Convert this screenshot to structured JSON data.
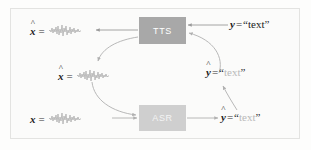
{
  "figure": {
    "background_color": "#fbfbfa",
    "border_color": "#e3e3e1"
  },
  "nodes": [
    {
      "id": "tts",
      "label": "TTS",
      "fill": "#a8a8a8",
      "text_color": "#ffffff"
    },
    {
      "id": "asr",
      "label": "ASR",
      "fill": "#cfcfcf",
      "text_color": "#f4f4f4"
    }
  ],
  "labels": {
    "top_left": {
      "name": "x-hat-top",
      "symbol": "x",
      "hat": "^",
      "equals": "=",
      "value_type": "waveform"
    },
    "middle_left": {
      "name": "x-hat-middle",
      "symbol": "x",
      "hat": "^",
      "equals": "=",
      "value_type": "waveform"
    },
    "bottom_left": {
      "name": "x-bottom",
      "symbol": "x",
      "hat": "",
      "equals": "=",
      "value_type": "waveform"
    },
    "top_right": {
      "name": "y-text",
      "symbol": "y",
      "hat": "",
      "equals": "=",
      "quote_open": "“",
      "value": "text",
      "quote_close": "”",
      "faded": false
    },
    "middle_right": {
      "name": "y-hat-text-middle",
      "symbol": "y",
      "hat": "^",
      "equals": "=",
      "quote_open": "“",
      "value": "text",
      "quote_close": "”",
      "faded": true
    },
    "bottom_right": {
      "name": "y-hat-text-bottom",
      "symbol": "y",
      "hat": "^",
      "equals": "=",
      "quote_open": "“",
      "value": "text",
      "quote_close": "”",
      "faded": true
    }
  },
  "edges": [
    {
      "name": "tts-to-xhat-top",
      "from": "tts",
      "to": "x-hat-top",
      "style": "straight",
      "direction": "left"
    },
    {
      "name": "y-text-to-tts",
      "from": "y-text",
      "to": "tts",
      "style": "straight",
      "direction": "left"
    },
    {
      "name": "yhat-middle-to-tts",
      "from": "y-hat-text-middle",
      "to": "tts",
      "style": "curved",
      "direction": "up-left"
    },
    {
      "name": "tts-to-xhat-middle",
      "from": "tts",
      "to": "x-hat-middle",
      "style": "curved",
      "direction": "down-left"
    },
    {
      "name": "xhat-middle-to-asr",
      "from": "x-hat-middle",
      "to": "asr",
      "style": "curved",
      "direction": "down-right"
    },
    {
      "name": "x-to-asr",
      "from": "x-bottom",
      "to": "asr",
      "style": "straight",
      "direction": "right"
    },
    {
      "name": "asr-to-yhat-bottom",
      "from": "asr",
      "to": "y-hat-text-bottom",
      "style": "straight",
      "direction": "right"
    },
    {
      "name": "yhat-bottom-to-yhat-middle",
      "from": "y-hat-text-bottom",
      "to": "y-hat-text-middle",
      "style": "curved",
      "direction": "up-left"
    }
  ],
  "colors": {
    "arrow": "#9a9a9a",
    "waveform": "#b6b6b6",
    "text": "#222222",
    "faded_text": "#b9b9b9"
  }
}
